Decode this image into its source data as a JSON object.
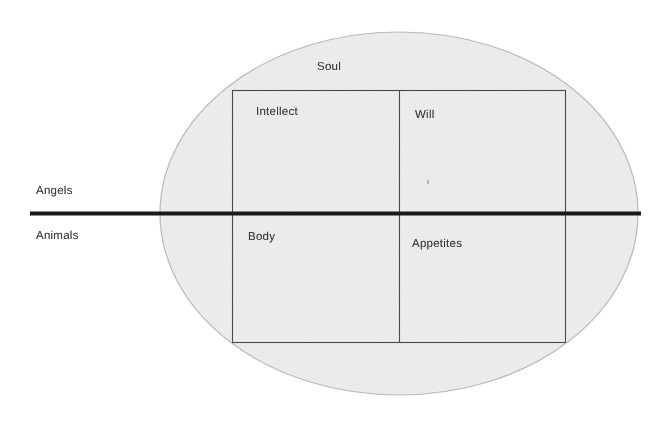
{
  "diagram": {
    "background_color": "#ffffff",
    "ellipse": {
      "name": "human-nature-ellipse",
      "fill_color": "#ededed",
      "stroke_color": "#b4b4b4"
    },
    "divider_line": {
      "name": "angels-animals-divider",
      "color": "#1a1a1a",
      "thickness_px": 4
    },
    "rectangle": {
      "name": "faculties-rectangle",
      "stroke_color": "#3a3a3a"
    },
    "labels": {
      "soul": "Soul",
      "intellect": "Intellect",
      "will": "Will",
      "body": "Body",
      "appetites": "Appetites",
      "angels": "Angels",
      "animals": "Animals"
    },
    "quadrants": [
      {
        "id": "upper-left",
        "label": "Intellect",
        "side": "Angels"
      },
      {
        "id": "upper-right",
        "label": "Will",
        "side": "Angels"
      },
      {
        "id": "lower-left",
        "label": "Body",
        "side": "Animals"
      },
      {
        "id": "lower-right",
        "label": "Appetites",
        "side": "Animals"
      }
    ],
    "outer_labels": [
      {
        "id": "top",
        "label": "Soul",
        "position": "inside-ellipse-top"
      },
      {
        "id": "left-above",
        "label": "Angels",
        "position": "left-of-ellipse-above-line"
      },
      {
        "id": "left-below",
        "label": "Animals",
        "position": "left-of-ellipse-below-line"
      }
    ]
  }
}
